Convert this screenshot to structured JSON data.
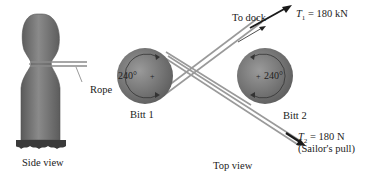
{
  "side_view": {
    "caption": "Side view",
    "rope_label": "Rope"
  },
  "top_view": {
    "caption": "Top view",
    "bitt1": {
      "label": "Bitt 1",
      "angle": "240°"
    },
    "bitt2": {
      "label": "Bitt 2",
      "angle": "240°"
    },
    "to_dock": "To dock",
    "t1": {
      "symbol": "T",
      "sub": "1",
      "value": "= 180 kN"
    },
    "t2": {
      "symbol": "T",
      "sub": "2",
      "value": "= 180 N",
      "note": "(Sailor's pull)"
    }
  },
  "colors": {
    "bitt_fill": "#7d7d7d",
    "bitt_dark": "#5a5a5a",
    "rope": "#9a9a9a",
    "arrow": "#1a1a1a",
    "text": "#222222"
  }
}
